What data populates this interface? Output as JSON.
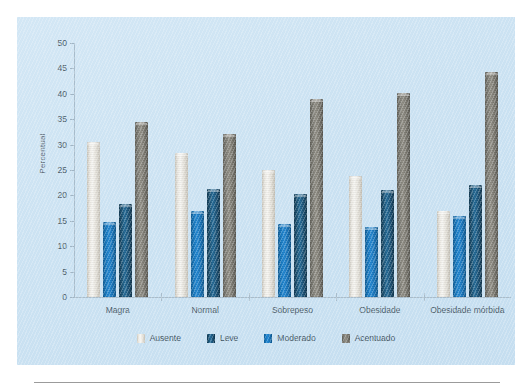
{
  "chart_data": {
    "type": "bar",
    "title": "",
    "xlabel": "",
    "ylabel": "Percentual",
    "ylim": [
      0,
      50
    ],
    "ystep": 5,
    "yticks": [
      "50",
      "45",
      "40",
      "35",
      "30",
      "25",
      "20",
      "15",
      "10",
      "5",
      "0"
    ],
    "grid": false,
    "legend_position": "bottom",
    "categories": [
      "Magra",
      "Normal",
      "Sobrepeso",
      "Obesidade",
      "Obesidade mórbida"
    ],
    "series": [
      {
        "name": "Ausente",
        "color": "#e3e0d8",
        "values": [
          30.5,
          28.3,
          25.0,
          23.8,
          17.0
        ]
      },
      {
        "name": "Leve",
        "color": "#1b4e75",
        "values": [
          18.3,
          21.3,
          20.3,
          21.0,
          22.1
        ]
      },
      {
        "name": "Moderado",
        "color": "#1878be",
        "values": [
          14.8,
          17.0,
          14.3,
          13.8,
          16.0
        ]
      },
      {
        "name": "Acentuado",
        "color": "#7b7a72",
        "values": [
          34.5,
          32.0,
          39.0,
          40.2,
          44.2
        ]
      }
    ],
    "bar_order_in_group": [
      "Ausente",
      "Moderado",
      "Leve",
      "Acentuado"
    ]
  },
  "legend": {
    "items": [
      {
        "label": "Ausente",
        "color": "#e3e0d8"
      },
      {
        "label": "Leve",
        "color": "#1b4e75"
      },
      {
        "label": "Moderado",
        "color": "#1878be"
      },
      {
        "label": "Acentuado",
        "color": "#7b7a72"
      }
    ]
  },
  "panel": {
    "background": "#cbe2f2"
  }
}
